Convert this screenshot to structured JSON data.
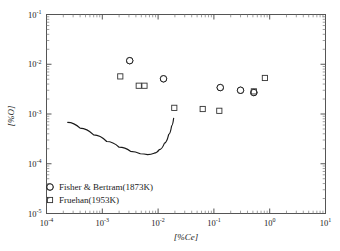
{
  "chart_data": {
    "type": "scatter",
    "title": "",
    "xlabel": "[%Ce]",
    "ylabel": "[%O]",
    "xscale": "log",
    "yscale": "log",
    "xlim": [
      0.0001,
      10
    ],
    "ylim": [
      1e-05,
      0.1
    ],
    "grid": false,
    "legend_position": "lower-left-inside",
    "x_tick_labels": [
      "10-4",
      "10-3",
      "10-2",
      "10-1",
      "100",
      "101"
    ],
    "x_tick_mantissa": [
      "10",
      "10",
      "10",
      "10",
      "10",
      "10"
    ],
    "x_tick_exponents": [
      "-4",
      "-3",
      "-2",
      "-1",
      "0",
      "1"
    ],
    "y_tick_mantissa": [
      "10",
      "10",
      "10",
      "10",
      "10"
    ],
    "y_tick_exponents": [
      "-1",
      "-2",
      "-3",
      "-4",
      "-5"
    ],
    "series": [
      {
        "name": "Fisher & Bertram(1873K)",
        "marker": "half-filled-circle",
        "points": [
          {
            "x": 0.0031,
            "y": 0.0118
          },
          {
            "x": 0.0125,
            "y": 0.0051
          },
          {
            "x": 0.13,
            "y": 0.0034
          },
          {
            "x": 0.3,
            "y": 0.003
          },
          {
            "x": 0.52,
            "y": 0.0027
          }
        ]
      },
      {
        "name": "Fruehan(1953K)",
        "marker": "open-square",
        "points": [
          {
            "x": 0.0021,
            "y": 0.0057
          },
          {
            "x": 0.0045,
            "y": 0.0037
          },
          {
            "x": 0.0057,
            "y": 0.0037
          },
          {
            "x": 0.0195,
            "y": 0.00133
          },
          {
            "x": 0.063,
            "y": 0.00126
          },
          {
            "x": 0.125,
            "y": 0.00116
          },
          {
            "x": 0.52,
            "y": 0.00285
          },
          {
            "x": 0.82,
            "y": 0.0053
          }
        ]
      }
    ],
    "curve": {
      "name": "equilibrium-curve",
      "points": [
        {
          "x": 0.00024,
          "y": 0.00068
        },
        {
          "x": 0.0004,
          "y": 0.00052
        },
        {
          "x": 0.0007,
          "y": 0.00038
        },
        {
          "x": 0.0012,
          "y": 0.00028
        },
        {
          "x": 0.002,
          "y": 0.000215
        },
        {
          "x": 0.0032,
          "y": 0.000178
        },
        {
          "x": 0.0048,
          "y": 0.000159
        },
        {
          "x": 0.0065,
          "y": 0.000153
        },
        {
          "x": 0.0085,
          "y": 0.000163
        },
        {
          "x": 0.0105,
          "y": 0.000192
        },
        {
          "x": 0.013,
          "y": 0.00026
        },
        {
          "x": 0.0155,
          "y": 0.00039
        },
        {
          "x": 0.0175,
          "y": 0.00058
        },
        {
          "x": 0.019,
          "y": 0.00082
        }
      ]
    }
  },
  "legend": {
    "entries": [
      {
        "label": "Fisher & Bertram(1873K)",
        "marker": "half-filled-circle"
      },
      {
        "label": "Fruehan(1953K)",
        "marker": "open-square"
      }
    ]
  }
}
